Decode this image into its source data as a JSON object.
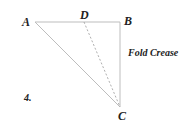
{
  "diagram": {
    "step_number": "4.",
    "points": {
      "A": {
        "label": "A",
        "x": 35,
        "y": 22
      },
      "B": {
        "label": "B",
        "x": 120,
        "y": 22
      },
      "C": {
        "label": "C",
        "x": 120,
        "y": 107
      },
      "D": {
        "label": "D",
        "x": 84,
        "y": 22
      }
    },
    "annotation": "Fold Crease",
    "colors": {
      "line": "#bdbdbd",
      "dashed": "#9a9a9a",
      "text": "#222222"
    }
  }
}
